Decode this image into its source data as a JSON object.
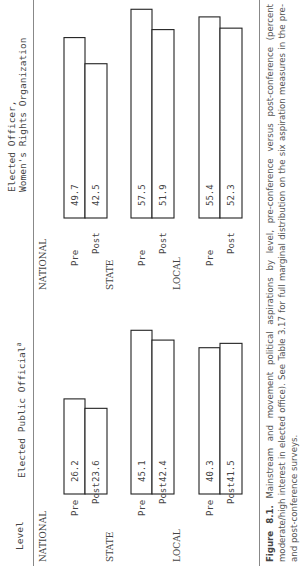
{
  "header": {
    "level_label": "Level",
    "left_panel_title": "Elected Public Official",
    "left_panel_superscript": "a",
    "right_panel_title_line1": "Elected Officer,",
    "right_panel_title_line2": "Women's Rights Organization"
  },
  "caption": {
    "figure_label": "Figure 8.1.",
    "text": "Mainstream and movement political aspirations by level, pre-conference versus post-conference (percent moderate/high interest in elected office). See Table 3.17 for full marginal distribution on the six aspiration measures in the pre- and post-conference surveys."
  },
  "chart_data": {
    "type": "bar",
    "orientation": "horizontal",
    "title": "",
    "xlabel": "",
    "ylabel": "Level",
    "value_unit": "percent moderate/high interest in elected office",
    "xlim": [
      0,
      60
    ],
    "grid": false,
    "legend": "none",
    "groups": [
      "NATIONAL",
      "STATE",
      "LOCAL"
    ],
    "categories": [
      "Pre",
      "Post"
    ],
    "panels": [
      {
        "name": "Elected Public Official",
        "superscript": "a",
        "values": {
          "NATIONAL": {
            "Pre": 26.2,
            "Post": 23.6
          },
          "STATE": {
            "Pre": 45.1,
            "Post": 42.4
          },
          "LOCAL": {
            "Pre": 40.3,
            "Post": 41.5
          }
        }
      },
      {
        "name": "Elected Officer, Women's Rights Organization",
        "values": {
          "NATIONAL": {
            "Pre": 49.7,
            "Post": 42.5
          },
          "STATE": {
            "Pre": 57.5,
            "Post": 51.9
          },
          "LOCAL": {
            "Pre": 55.4,
            "Post": 52.3
          }
        }
      }
    ]
  }
}
